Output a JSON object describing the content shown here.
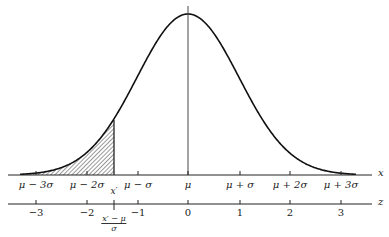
{
  "diagram": {
    "type": "normal-distribution-curve",
    "shaded_region": "area under curve left of x'",
    "x_axis": {
      "name": "x",
      "ticks": [
        {
          "label": "μ − 3σ",
          "pos": 36
        },
        {
          "label": "μ − 2σ",
          "pos": 87
        },
        {
          "label": "μ − σ",
          "pos": 138
        },
        {
          "label": "μ",
          "pos": 188
        },
        {
          "label": "μ + σ",
          "pos": 240
        },
        {
          "label": "μ + 2σ",
          "pos": 290
        },
        {
          "label": "μ + 3σ",
          "pos": 341
        }
      ],
      "marker": {
        "label": "x′",
        "pos": 114
      }
    },
    "z_axis": {
      "name": "z",
      "ticks": [
        {
          "label": "−3",
          "pos": 36
        },
        {
          "label": "−2",
          "pos": 87
        },
        {
          "label": "−1",
          "pos": 138
        },
        {
          "label": "0",
          "pos": 188
        },
        {
          "label": "1",
          "pos": 240
        },
        {
          "label": "2",
          "pos": 290
        },
        {
          "label": "3",
          "pos": 341
        }
      ],
      "marker": {
        "numerator": "x′ − μ",
        "denominator": "σ",
        "pos": 114
      }
    }
  }
}
